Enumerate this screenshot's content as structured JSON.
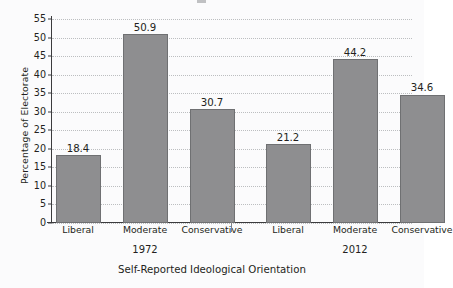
{
  "chart_data": {
    "type": "bar",
    "title": "",
    "xlabel": "Self-Reported Ideological Orientation",
    "ylabel": "Percentage of Electorate",
    "categories": [
      "Liberal",
      "Moderate",
      "Conservative",
      "Liberal",
      "Moderate",
      "Conservative"
    ],
    "values": [
      18.4,
      50.9,
      30.7,
      21.2,
      44.2,
      34.6
    ],
    "value_labels": [
      "18.4",
      "50.9",
      "30.7",
      "21.2",
      "44.2",
      "34.6"
    ],
    "groups": [
      {
        "label": "1972",
        "categories": [
          "Liberal",
          "Moderate",
          "Conservative"
        ],
        "values": [
          18.4,
          50.9,
          30.7
        ]
      },
      {
        "label": "2012",
        "categories": [
          "Liberal",
          "Moderate",
          "Conservative"
        ],
        "values": [
          21.2,
          44.2,
          34.6
        ]
      }
    ],
    "ylim": [
      0,
      55
    ],
    "ytick_labels": [
      "0",
      "5",
      "10",
      "15",
      "20",
      "25",
      "30",
      "35",
      "40",
      "45",
      "50",
      "55"
    ],
    "ytick_values": [
      0,
      5,
      10,
      15,
      20,
      25,
      30,
      35,
      40,
      45,
      50,
      55
    ],
    "grid": "horizontal-dotted",
    "legend": "none",
    "colors": {
      "bar_fill": "#8e8e90",
      "bar_stroke": "#6f7072",
      "gridline": "#bcbec0",
      "axis": "#3b3b3d",
      "text": "#231f20",
      "background": "#fbfbfc"
    }
  }
}
